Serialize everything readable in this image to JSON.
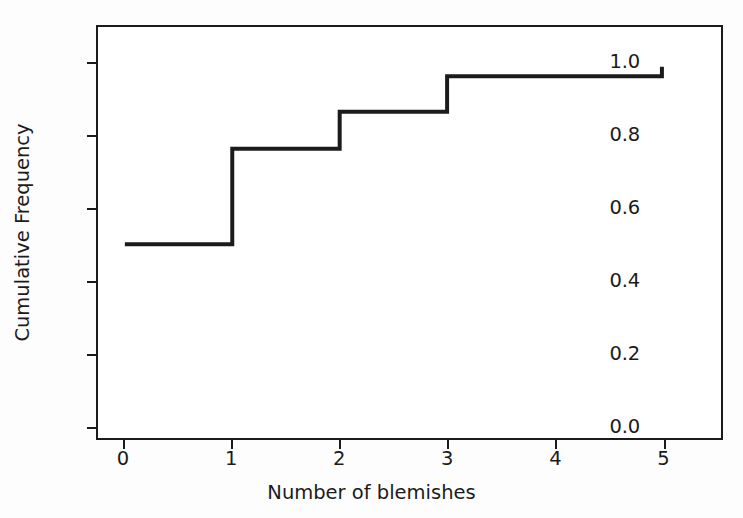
{
  "chart_data": {
    "type": "line",
    "subtype": "step-post",
    "title": "",
    "xlabel": "Number of blemishes",
    "ylabel": "Cumulative Frequency",
    "xlim": [
      -0.25,
      5.55
    ],
    "ylim": [
      -0.035,
      1.1
    ],
    "grid": false,
    "legend": null,
    "line_color": "#1b1b1b",
    "line_width": 4,
    "x": [
      0,
      1,
      2,
      3,
      4,
      5
    ],
    "values": [
      0.5,
      0.764,
      0.866,
      0.964,
      0.964,
      0.99
    ],
    "series": [
      {
        "name": "Cumulative frequency",
        "x": [
          0,
          1,
          2,
          3,
          4,
          5
        ],
        "values": [
          0.5,
          0.764,
          0.866,
          0.964,
          0.964,
          0.99
        ]
      }
    ],
    "steps": [
      {
        "x_start": 0,
        "x_end": 1,
        "y": 0.5
      },
      {
        "x_start": 1,
        "x_end": 2,
        "y": 0.764
      },
      {
        "x_start": 2,
        "x_end": 3,
        "y": 0.866
      },
      {
        "x_start": 3,
        "x_end": 5,
        "y": 0.964
      },
      {
        "x_start": 5,
        "x_end": 5,
        "y": 0.99
      }
    ],
    "xticks": [
      {
        "value": 0,
        "label": "0"
      },
      {
        "value": 1,
        "label": "1"
      },
      {
        "value": 2,
        "label": "2"
      },
      {
        "value": 3,
        "label": "3"
      },
      {
        "value": 4,
        "label": "4"
      },
      {
        "value": 5,
        "label": "5"
      }
    ],
    "yticks": [
      {
        "value": 0.0,
        "label": "0.0"
      },
      {
        "value": 0.2,
        "label": "0.2"
      },
      {
        "value": 0.4,
        "label": "0.4"
      },
      {
        "value": 0.6,
        "label": "0.6"
      },
      {
        "value": 0.8,
        "label": "0.8"
      },
      {
        "value": 1.0,
        "label": "1.0"
      }
    ]
  }
}
